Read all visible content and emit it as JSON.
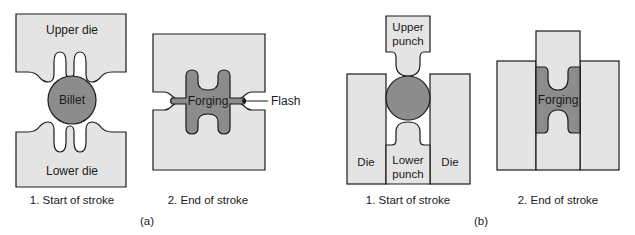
{
  "figure": {
    "panel_a": {
      "tag": "(a)",
      "step1": {
        "caption": "1. Start of stroke",
        "upper_die_label": "Upper die",
        "lower_die_label": "Lower die",
        "billet_label": "Billet"
      },
      "step2": {
        "caption": "2. End of stroke",
        "forging_label": "Forging",
        "flash_label": "Flash"
      }
    },
    "panel_b": {
      "tag": "(b)",
      "step1": {
        "caption": "1. Start of stroke",
        "upper_punch_label_line1": "Upper",
        "upper_punch_label_line2": "punch",
        "lower_punch_label_line1": "Lower",
        "lower_punch_label_line2": "punch",
        "left_die_label": "Die",
        "right_die_label": "Die"
      },
      "step2": {
        "caption": "2. End of stroke",
        "forging_label": "Forging"
      }
    },
    "colors": {
      "die_fill": "#e4e4e4",
      "workpiece_fill": "#8c8c8c",
      "outline": "#1a1a1a"
    }
  }
}
